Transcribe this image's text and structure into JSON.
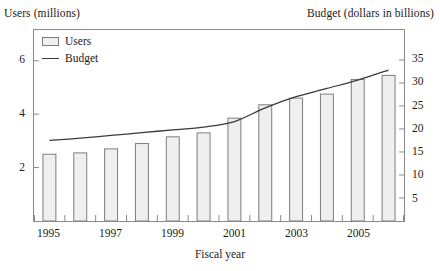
{
  "chart_data": {
    "type": "bar",
    "title": "",
    "xlabel": "Fiscal year",
    "categories": [
      "1995",
      "1996",
      "1997",
      "1998",
      "1999",
      "2000",
      "2001",
      "2002",
      "2003",
      "2004",
      "2005",
      "2006"
    ],
    "x_tick_labels": [
      "1995",
      "1997",
      "1999",
      "2001",
      "2003",
      "2005"
    ],
    "grid": false,
    "legend_position": "top-left",
    "axes": {
      "left": {
        "label": "Users (millions)",
        "ticks": [
          2,
          4,
          6
        ],
        "tick_labels": [
          "2",
          "4",
          "6"
        ],
        "ylim": [
          0,
          7.15
        ]
      },
      "right": {
        "label": "Budget (dollars in billions)",
        "ticks": [
          5,
          10,
          15,
          20,
          25,
          30,
          35
        ],
        "tick_labels": [
          "5",
          "10",
          "15",
          "20",
          "25",
          "30",
          "35"
        ],
        "ylim": [
          0,
          41.5
        ]
      }
    },
    "series": [
      {
        "name": "Users",
        "type": "bar",
        "axis": "left",
        "unit": "millions",
        "color": "#efefef",
        "edge_color": "#7d7d7d",
        "values": [
          2.5,
          2.55,
          2.7,
          2.9,
          3.15,
          3.3,
          3.85,
          4.35,
          4.6,
          4.75,
          5.3,
          5.45
        ]
      },
      {
        "name": "Budget",
        "type": "line",
        "axis": "right",
        "unit": "dollars in billions",
        "color": "#3a3a3a",
        "values": [
          17.5,
          18.0,
          18.6,
          19.2,
          19.8,
          20.4,
          21.6,
          24.6,
          27.0,
          28.8,
          30.6,
          32.8
        ]
      }
    ]
  },
  "legend": {
    "items": [
      {
        "label": "Users",
        "marker": "box-swatch"
      },
      {
        "label": "Budget",
        "marker": "line-swatch"
      }
    ]
  },
  "axis_titles": {
    "left": "Users (millions)",
    "right": "Budget (dollars in billions)",
    "bottom": "Fiscal year"
  },
  "colors": {
    "frame": "#8a8a8a",
    "bar_fill": "#efefef",
    "bar_edge": "#7d7d7d",
    "line": "#3a3a3a",
    "text": "#1a1a1a",
    "background": "#ffffff"
  }
}
